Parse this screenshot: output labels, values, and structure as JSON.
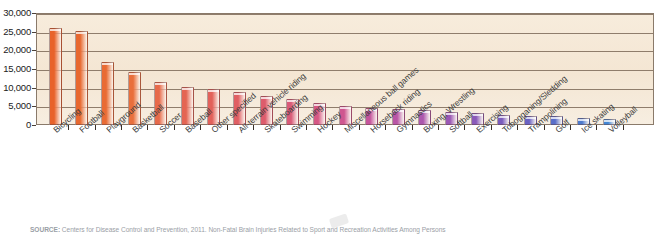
{
  "chart_data": {
    "type": "bar",
    "title": "",
    "xlabel": "",
    "ylabel": "",
    "ylim": [
      0,
      30000
    ],
    "grid": true,
    "legend": "none",
    "yticks": [
      "30,000",
      "25,000",
      "20,000",
      "15,000",
      "10,000",
      "5,000",
      "0"
    ],
    "ytick_values": [
      30000,
      25000,
      20000,
      15000,
      10000,
      5000,
      0
    ],
    "categories": [
      "Bicycling",
      "Football",
      "Playground",
      "Basketball",
      "Soccer",
      "Baseball",
      "Other specified",
      "All-terrain vehicle riding",
      "Skateboarding",
      "Swimming",
      "Hockey",
      "Miscellaneous ball games",
      "Horseback riding",
      "Gymnastics",
      "Boxing, Wrestling",
      "Softball",
      "Exercising",
      "Tobogganing/Sledding",
      "Trampolining",
      "Golf",
      "Ice skating",
      "Volleyball"
    ],
    "values": [
      26000,
      25300,
      16800,
      14100,
      11400,
      10300,
      9600,
      8900,
      7900,
      6900,
      6000,
      5000,
      4600,
      4400,
      3900,
      3400,
      3100,
      2700,
      2500,
      2300,
      2000,
      1700
    ],
    "bar_colors": [
      "#e8622a",
      "#e8682f",
      "#e96b34",
      "#e96f3c",
      "#e76a4a",
      "#e46553",
      "#e2615a",
      "#e05f63",
      "#dd5c6c",
      "#d95a78",
      "#d65884",
      "#cf5690",
      "#c5559c",
      "#b956a6",
      "#ac57ad",
      "#9b58b4",
      "#8a5ab9",
      "#7a5cbd",
      "#6a62c3",
      "#5a6ec9",
      "#4c7ace",
      "#4487d4"
    ]
  },
  "source": {
    "label": "SOURCE:",
    "text": " Centers for Disease Control and Prevention, 2011. Non-Fatal Brain Injuries Related to Sport and Recreation Activities Among Persons"
  }
}
